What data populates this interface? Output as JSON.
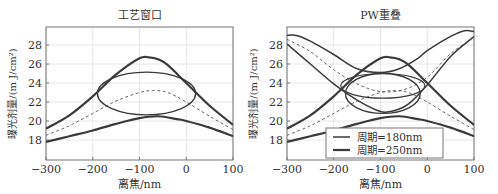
{
  "chart_data": [
    {
      "type": "line",
      "title": "工艺窗口",
      "xlabel": "离焦/nm",
      "ylabel": "曝光剂量/(m J/cm²)",
      "xlim": [
        -300,
        100
      ],
      "ylim": [
        16,
        30
      ],
      "xticks": [
        -300,
        -200,
        -100,
        0,
        100
      ],
      "yticks": [
        18,
        20,
        22,
        24,
        26,
        28
      ],
      "grid": true,
      "series": [
        {
          "name": "upper",
          "style": "thick",
          "x": [
            -300,
            -250,
            -200,
            -150,
            -100,
            -80,
            -60,
            -40,
            0,
            50,
            100
          ],
          "values": [
            19.2,
            20.6,
            22.6,
            24.9,
            26.6,
            26.7,
            26.5,
            25.9,
            24.0,
            21.6,
            19.6
          ]
        },
        {
          "name": "lower",
          "style": "thick",
          "x": [
            -300,
            -250,
            -200,
            -150,
            -100,
            -60,
            -20,
            0,
            50,
            100
          ],
          "values": [
            17.8,
            18.4,
            19.0,
            19.7,
            20.3,
            20.5,
            20.2,
            20.0,
            19.3,
            18.4
          ]
        },
        {
          "name": "center",
          "style": "dashed",
          "x": [
            -300,
            -250,
            -200,
            -150,
            -100,
            -70,
            -40,
            0,
            50,
            100
          ],
          "values": [
            18.5,
            19.5,
            20.8,
            22.1,
            23.0,
            23.2,
            23.0,
            22.0,
            20.5,
            19.1
          ]
        },
        {
          "name": "window-ellipse",
          "style": "ellipse",
          "center": [
            -85,
            22.9
          ],
          "rx": 105,
          "ry": 2.25
        }
      ]
    },
    {
      "type": "line",
      "title": "PW重叠",
      "xlabel": "离焦/nm",
      "ylabel": "曝光剂量/(m J/cm²)",
      "xlim": [
        -300,
        100
      ],
      "ylim": [
        16,
        30
      ],
      "xticks": [
        -300,
        -200,
        -100,
        0,
        100
      ],
      "yticks": [
        18,
        20,
        22,
        24,
        26,
        28
      ],
      "grid": true,
      "legend": {
        "position": "lower center",
        "entries": [
          "周期=180nm",
          "周期=250nm"
        ]
      },
      "series": [
        {
          "name": "周期=180nm upper",
          "x": [
            -300,
            -280,
            -250,
            -200,
            -150,
            -100,
            -60,
            -20,
            0,
            50,
            80,
            100
          ],
          "values": [
            29.0,
            29.0,
            28.4,
            27.0,
            25.5,
            25.1,
            25.5,
            26.6,
            27.4,
            28.9,
            29.5,
            29.4
          ]
        },
        {
          "name": "周期=180nm lower",
          "x": [
            -300,
            -250,
            -200,
            -150,
            -100,
            -70,
            -40,
            0,
            50,
            100
          ],
          "values": [
            28.1,
            26.0,
            23.9,
            22.2,
            21.0,
            21.1,
            21.8,
            23.8,
            26.8,
            28.9
          ]
        },
        {
          "name": "周期=180nm center",
          "style": "dashed",
          "x": [
            -300,
            -250,
            -200,
            -150,
            -100,
            -50,
            0,
            50,
            100
          ],
          "values": [
            28.6,
            27.3,
            25.4,
            23.9,
            23.1,
            23.3,
            24.6,
            27.1,
            28.8
          ]
        },
        {
          "name": "周期=250nm upper",
          "x": [
            -300,
            -250,
            -200,
            -150,
            -100,
            -80,
            -60,
            -40,
            0,
            50,
            100
          ],
          "values": [
            19.2,
            20.6,
            22.6,
            24.9,
            26.6,
            26.7,
            26.5,
            25.9,
            24.0,
            21.6,
            19.6
          ]
        },
        {
          "name": "周期=250nm lower",
          "x": [
            -300,
            -250,
            -200,
            -150,
            -100,
            -60,
            -20,
            0,
            50,
            100
          ],
          "values": [
            17.8,
            18.4,
            19.0,
            19.7,
            20.3,
            20.5,
            20.2,
            20.0,
            19.3,
            18.4
          ]
        },
        {
          "name": "周期=250nm center",
          "style": "dashed",
          "x": [
            -300,
            -250,
            -200,
            -150,
            -100,
            -70,
            -40,
            0,
            50,
            100
          ],
          "values": [
            18.5,
            19.5,
            20.8,
            22.1,
            23.0,
            23.2,
            23.0,
            22.0,
            20.5,
            19.1
          ]
        },
        {
          "name": "180nm window",
          "style": "ellipse",
          "center": [
            -95,
            23.7
          ],
          "rx": 90,
          "ry": 1.3
        },
        {
          "name": "250nm window",
          "style": "ellipse",
          "center": [
            -95,
            22.9
          ],
          "rx": 80,
          "ry": 2.1
        }
      ]
    }
  ],
  "panels": [
    {
      "title": "工艺窗口",
      "xlabel": "离焦/nm",
      "ylabel": "曝光剂量/(m J/cm²)"
    },
    {
      "title": "PW重叠",
      "xlabel": "离焦/nm",
      "ylabel": "曝光剂量/(m J/cm²)",
      "legend": [
        "周期=180nm",
        "周期=250nm"
      ]
    }
  ],
  "colors": {
    "line": "#3a3a3a",
    "thin": "#555555",
    "grid": "#e6e6e6",
    "axis": "#777777"
  }
}
